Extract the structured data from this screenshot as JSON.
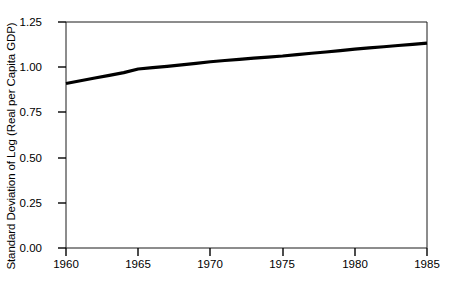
{
  "chart_data": {
    "type": "line",
    "title": "",
    "xlabel": "",
    "ylabel": "Standard Deviation of Log (Real per Capita GDP)",
    "xlim": [
      1960,
      1985
    ],
    "ylim": [
      0.0,
      1.25
    ],
    "grid": false,
    "legend": "none",
    "x_ticks": [
      "1960",
      "1965",
      "1970",
      "1975",
      "1980",
      "1985"
    ],
    "y_ticks": [
      "0.00",
      "0.25",
      "0.50",
      "0.75",
      "1.00",
      "1.25"
    ],
    "series": [
      {
        "name": "Standard Deviation of Log (Real per Capita GDP)",
        "color": "#000000",
        "x": [
          1960,
          1961,
          1962,
          1963,
          1964,
          1965,
          1966,
          1967,
          1968,
          1969,
          1970,
          1971,
          1972,
          1973,
          1974,
          1975,
          1976,
          1977,
          1978,
          1979,
          1980,
          1981,
          1982,
          1983,
          1984,
          1985
        ],
        "values": [
          0.91,
          0.925,
          0.94,
          0.955,
          0.97,
          0.99,
          0.998,
          1.005,
          1.013,
          1.021,
          1.03,
          1.037,
          1.043,
          1.05,
          1.056,
          1.062,
          1.07,
          1.077,
          1.084,
          1.092,
          1.1,
          1.107,
          1.113,
          1.12,
          1.126,
          1.133
        ]
      }
    ]
  },
  "axes": {
    "y_title": "Standard Deviation of Log (Real per Capita GDP)",
    "y_tick_labels": [
      "1.25",
      "1.00",
      "0.75",
      "0.50",
      "0.25",
      "0.00"
    ],
    "x_tick_labels": [
      "1960",
      "1965",
      "1970",
      "1975",
      "1980",
      "1985"
    ]
  }
}
